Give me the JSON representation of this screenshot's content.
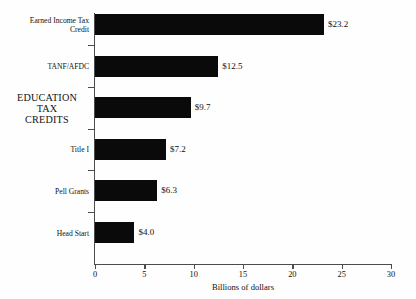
{
  "chart_data": {
    "type": "bar",
    "orientation": "horizontal",
    "title": "",
    "subtitle": "",
    "xlabel": "Billions of dollars",
    "ylabel": "",
    "xlim": [
      0,
      30
    ],
    "xticks": [
      0,
      5,
      10,
      15,
      20,
      25,
      30
    ],
    "xtick_labels": [
      "0",
      "5",
      "10",
      "15",
      "20",
      "25",
      "30"
    ],
    "grid": false,
    "legend": null,
    "bar_color": "#0a0a0a",
    "axis_color": "#4c4c4c",
    "background_color": "#fefefe",
    "categories": [
      "Earned Income Tax Credit",
      "TANF/AFDC",
      "EDUCATION TAX CREDITS",
      "Title I",
      "Pell Grants",
      "Head Start"
    ],
    "values": [
      23.2,
      12.5,
      9.7,
      7.2,
      6.3,
      4.0
    ],
    "value_labels": [
      "$23.2",
      "$12.5",
      "$9.7",
      "$7.2",
      "$6.3",
      "$4.0"
    ],
    "bars": [
      {
        "category": "Earned Income Tax Credit",
        "label_lines": "Earned Income Tax\nCredit",
        "value": 23.2,
        "value_label": "$23.2",
        "emphasis": false
      },
      {
        "category": "TANF/AFDC",
        "label_lines": "TANF/AFDC",
        "value": 12.5,
        "value_label": "$12.5",
        "emphasis": false
      },
      {
        "category": "EDUCATION TAX CREDITS",
        "label_lines": "EDUCATION\nTAX\nCREDITS",
        "value": 9.7,
        "value_label": "$9.7",
        "emphasis": true
      },
      {
        "category": "Title I",
        "label_lines": "Title I",
        "value": 7.2,
        "value_label": "$7.2",
        "emphasis": false
      },
      {
        "category": "Pell Grants",
        "label_lines": "Pell Grants",
        "value": 6.3,
        "value_label": "$6.3",
        "emphasis": false
      },
      {
        "category": "Head Start",
        "label_lines": "Head Start",
        "value": 4.0,
        "value_label": "$4.0",
        "emphasis": false
      }
    ]
  }
}
